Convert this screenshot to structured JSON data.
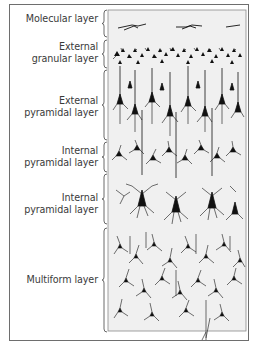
{
  "figure": {
    "type": "cortical layer diagram",
    "layers": [
      {
        "id": "molecular",
        "label_lines": [
          "Molecular layer"
        ],
        "y_range": [
          10,
          37
        ]
      },
      {
        "id": "external-granular",
        "label_lines": [
          "External",
          "granular layer"
        ],
        "y_range": [
          40,
          68
        ]
      },
      {
        "id": "external-pyramidal",
        "label_lines": [
          "External",
          "pyramidal layer"
        ],
        "y_range": [
          70,
          140
        ]
      },
      {
        "id": "internal-pyramidal-1",
        "label_lines": [
          "Internal",
          "pyramidal layer"
        ],
        "y_range": [
          142,
          172
        ]
      },
      {
        "id": "internal-pyramidal-2",
        "label_lines": [
          "Internal",
          "pyramidal layer"
        ],
        "y_range": [
          173,
          225
        ]
      },
      {
        "id": "multiform",
        "label_lines": [
          "Multiform layer"
        ],
        "y_range": [
          226,
          330
        ]
      }
    ],
    "colors": {
      "panel": "#f0f0f0",
      "ink": "#111111",
      "frame": "#6e6e6e",
      "label": "#3a3a3a"
    }
  }
}
